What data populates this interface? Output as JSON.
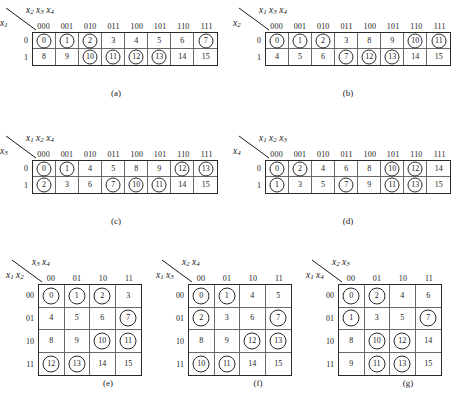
{
  "figure": {
    "type": "karnaugh-map-collection",
    "count": 7,
    "cell_note": "numbers are minterm indices; circled cells mark the function's 1-cells"
  },
  "maps": [
    {
      "id": "a",
      "caption": "(a)",
      "shape": "1x8",
      "top_label_html": "x<sub>2</sub> x<sub>3</sub> x<sub>4</sub>",
      "side_label_html": "x<sub>1</sub>",
      "col_headers": [
        "000",
        "001",
        "010",
        "011",
        "100",
        "101",
        "110",
        "111"
      ],
      "row_headers": [
        "0",
        "1"
      ],
      "rows": [
        [
          0,
          1,
          2,
          3,
          4,
          5,
          6,
          7
        ],
        [
          8,
          9,
          10,
          11,
          12,
          13,
          14,
          15
        ]
      ],
      "circled": [
        0,
        1,
        2,
        7,
        10,
        11,
        12,
        13
      ]
    },
    {
      "id": "b",
      "caption": "(b)",
      "shape": "1x8",
      "top_label_html": "x<sub>1</sub> x<sub>3</sub> x<sub>4</sub>",
      "side_label_html": "x<sub>2</sub>",
      "col_headers": [
        "000",
        "001",
        "010",
        "011",
        "100",
        "101",
        "110",
        "111"
      ],
      "row_headers": [
        "0",
        "1"
      ],
      "rows": [
        [
          0,
          1,
          2,
          3,
          8,
          9,
          10,
          11
        ],
        [
          4,
          5,
          6,
          7,
          12,
          13,
          14,
          15
        ]
      ],
      "circled": [
        0,
        1,
        2,
        10,
        11,
        7,
        12,
        13
      ]
    },
    {
      "id": "c",
      "caption": "(c)",
      "shape": "1x8",
      "top_label_html": "x<sub>1</sub> x<sub>2</sub> x<sub>4</sub>",
      "side_label_html": "x<sub>3</sub>",
      "col_headers": [
        "000",
        "001",
        "010",
        "011",
        "100",
        "101",
        "110",
        "111"
      ],
      "row_headers": [
        "0",
        "1"
      ],
      "rows": [
        [
          0,
          1,
          4,
          5,
          8,
          9,
          12,
          13
        ],
        [
          2,
          3,
          6,
          7,
          10,
          11,
          14,
          15
        ]
      ],
      "circled": [
        0,
        1,
        12,
        13,
        2,
        7,
        10,
        11
      ]
    },
    {
      "id": "d",
      "caption": "(d)",
      "shape": "1x8",
      "top_label_html": "x<sub>1</sub> x<sub>2</sub> x<sub>3</sub>",
      "side_label_html": "x<sub>4</sub>",
      "col_headers": [
        "000",
        "001",
        "010",
        "011",
        "100",
        "101",
        "110",
        "111"
      ],
      "row_headers": [
        "0",
        "1"
      ],
      "rows": [
        [
          0,
          2,
          4,
          6,
          8,
          10,
          12,
          14
        ],
        [
          1,
          3,
          5,
          7,
          9,
          11,
          13,
          15
        ]
      ],
      "circled": [
        0,
        2,
        10,
        12,
        1,
        7,
        11,
        13
      ]
    },
    {
      "id": "e",
      "caption": "(e)",
      "shape": "4x4",
      "top_label_html": "x<sub>3</sub> x<sub>4</sub>",
      "side_label_html": "x<sub>1</sub> x<sub>2</sub>",
      "col_headers": [
        "00",
        "01",
        "10",
        "11"
      ],
      "row_headers": [
        "00",
        "01",
        "10",
        "11"
      ],
      "rows": [
        [
          0,
          1,
          2,
          3
        ],
        [
          4,
          5,
          6,
          7
        ],
        [
          8,
          9,
          10,
          11
        ],
        [
          12,
          13,
          14,
          15
        ]
      ],
      "circled": [
        0,
        1,
        2,
        7,
        10,
        11,
        12,
        13
      ]
    },
    {
      "id": "f",
      "caption": "(f)",
      "shape": "4x4",
      "top_label_html": "x<sub>2</sub> x<sub>4</sub>",
      "side_label_html": "x<sub>1</sub> x<sub>3</sub>",
      "col_headers": [
        "00",
        "01",
        "10",
        "11"
      ],
      "row_headers": [
        "00",
        "01",
        "10",
        "11"
      ],
      "rows": [
        [
          0,
          1,
          4,
          5
        ],
        [
          2,
          3,
          6,
          7
        ],
        [
          8,
          9,
          12,
          13
        ],
        [
          10,
          11,
          14,
          15
        ]
      ],
      "circled": [
        0,
        1,
        2,
        7,
        12,
        13,
        10,
        11
      ]
    },
    {
      "id": "g",
      "caption": "(g)",
      "shape": "4x4",
      "top_label_html": "x<sub>2</sub> x<sub>3</sub>",
      "side_label_html": "x<sub>1</sub> x<sub>4</sub>",
      "col_headers": [
        "00",
        "01",
        "10",
        "11"
      ],
      "row_headers": [
        "00",
        "01",
        "10",
        "11"
      ],
      "rows": [
        [
          0,
          2,
          4,
          6
        ],
        [
          1,
          3,
          5,
          7
        ],
        [
          8,
          10,
          12,
          14
        ],
        [
          9,
          11,
          13,
          15
        ]
      ],
      "circled": [
        0,
        2,
        1,
        7,
        10,
        12,
        11,
        13
      ]
    }
  ]
}
